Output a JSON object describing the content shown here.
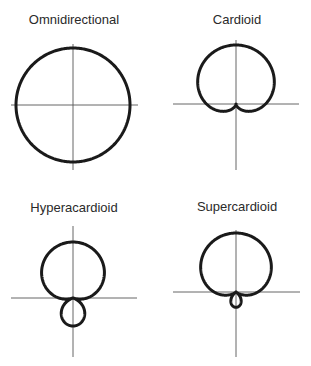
{
  "diagram": {
    "stroke_color": "#1a1a1a",
    "axis_color": "#555555",
    "panels": [
      {
        "id": "omnidirectional",
        "title": "Omnidirectional",
        "pattern": {
          "a": 1.0,
          "b": 0.0
        },
        "title_pos": [
          74,
          13
        ],
        "center": [
          73,
          105
        ],
        "scale": 57,
        "h_axis": [
          11,
          138
        ],
        "v_axis": [
          44,
          170
        ]
      },
      {
        "id": "cardioid",
        "title": "Cardioid",
        "pattern": {
          "a": 0.5,
          "b": 0.5
        },
        "title_pos": [
          237,
          13
        ],
        "center": [
          236,
          104
        ],
        "scale": 59,
        "h_axis": [
          173,
          299
        ],
        "v_axis": [
          40,
          170
        ]
      },
      {
        "id": "hyperacardioid",
        "title": "Hyperacardioid",
        "pattern": {
          "a": 0.25,
          "b": 0.75
        },
        "title_pos": [
          74,
          201
        ],
        "center": [
          73,
          298
        ],
        "scale": 56,
        "h_axis": [
          11,
          137
        ],
        "v_axis": [
          226,
          357
        ]
      },
      {
        "id": "supercardioid",
        "title": "Supercardioid",
        "pattern": {
          "a": 0.37,
          "b": 0.63
        },
        "title_pos": [
          237,
          200
        ],
        "center": [
          236,
          292
        ],
        "scale": 59,
        "h_axis": [
          173,
          300
        ],
        "v_axis": [
          230,
          357
        ]
      }
    ]
  }
}
